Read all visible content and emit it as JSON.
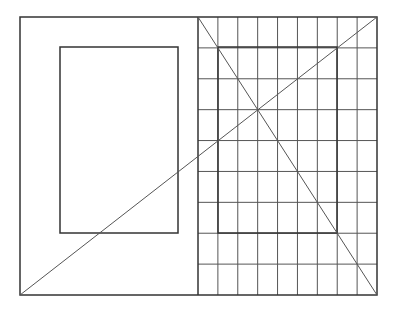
{
  "diagram": {
    "width": 395,
    "height": 310,
    "stroke_color": "#333333",
    "grid_color": "#555555",
    "background": "#ffffff",
    "outer_frame": {
      "x": 20,
      "y": 17,
      "w": 357,
      "h": 278
    },
    "divider_x": 198,
    "left_inner_rect": {
      "x": 60,
      "y": 47,
      "w": 118,
      "h": 186
    },
    "right_inner_rect": {
      "x": 218,
      "y": 47,
      "w": 119,
      "h": 186
    },
    "grid": {
      "x0": 198,
      "y0": 17,
      "x1": 377,
      "y1": 295,
      "columns": 9,
      "rows": 9
    },
    "diagonals": [
      {
        "x1": 20,
        "y1": 295,
        "x2": 377,
        "y2": 17
      },
      {
        "x1": 198,
        "y1": 17,
        "x2": 377,
        "y2": 295
      }
    ]
  }
}
